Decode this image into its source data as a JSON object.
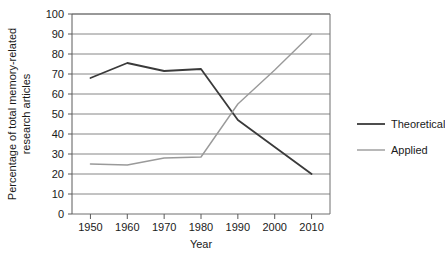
{
  "chart_data": {
    "type": "line",
    "title": "",
    "xlabel": "Year",
    "ylabel": "Percentage of total memory-related research articles",
    "ylabel_line1": "Percentage of total memory-related",
    "ylabel_line2": "research articles",
    "x": [
      1950,
      1960,
      1970,
      1980,
      1990,
      2000,
      2010
    ],
    "xlim": [
      1945,
      2015
    ],
    "ylim": [
      0,
      100
    ],
    "xticks": [
      "1950",
      "1960",
      "1970",
      "1980",
      "1990",
      "2000",
      "2010"
    ],
    "yticks": [
      "0",
      "10",
      "20",
      "30",
      "40",
      "50",
      "60",
      "70",
      "80",
      "90",
      "100"
    ],
    "grid": true,
    "grid_axis": "y",
    "legend_position": "right",
    "series": [
      {
        "name": "Theoretical",
        "color": "#3a3a3a",
        "x": [
          1950,
          1960,
          1970,
          1980,
          1990,
          2000,
          2010
        ],
        "values": [
          68,
          75.5,
          71.5,
          72.5,
          47,
          33.5,
          20
        ]
      },
      {
        "name": "Applied",
        "color": "#9a9a9a",
        "x": [
          1950,
          1960,
          1970,
          1980,
          1990,
          2000,
          2010
        ],
        "values": [
          25,
          24.5,
          28,
          28.5,
          55,
          72,
          90
        ]
      }
    ],
    "annotations": {
      "crossover_year": "1988",
      "crossover_value": "50"
    }
  },
  "legend": {
    "items": [
      {
        "label": "Theoretical",
        "color": "#3a3a3a"
      },
      {
        "label": "Applied",
        "color": "#9a9a9a"
      }
    ]
  }
}
